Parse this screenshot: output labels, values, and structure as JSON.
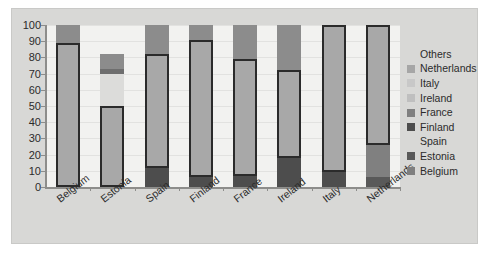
{
  "chart_data": {
    "type": "bar",
    "subtype": "stacked-bar-with-highlighted-segment",
    "title": "",
    "xlabel": "",
    "ylabel": "",
    "ylim": [
      0,
      100
    ],
    "ytick_labels": [
      "0",
      "10",
      "20",
      "30",
      "40",
      "50",
      "60",
      "70",
      "80",
      "90",
      "100"
    ],
    "ytick_values": [
      0,
      10,
      20,
      30,
      40,
      50,
      60,
      70,
      80,
      90,
      100
    ],
    "grid": true,
    "legend_position": "right",
    "categories": [
      "Belgium",
      "Estonia",
      "Spain",
      "Finland",
      "France",
      "Ireland",
      "Italy",
      "Netherlands"
    ],
    "series": [
      {
        "name": "Belgium",
        "color": "#7f7f7f",
        "values": [
          0,
          0,
          0,
          0,
          0,
          0,
          0,
          0
        ]
      },
      {
        "name": "Estonia",
        "color": "#595959",
        "values": [
          0,
          0,
          0,
          0,
          0,
          0,
          0,
          6
        ]
      },
      {
        "name": "Spain",
        "color": "#f2f2f0",
        "values": [
          0,
          0,
          0,
          0,
          0,
          0,
          0,
          0
        ]
      },
      {
        "name": "Finland",
        "color": "#4d4d4d",
        "values": [
          0,
          0,
          12,
          6,
          7,
          0,
          0,
          0
        ]
      },
      {
        "name": "France",
        "color": "#808080",
        "values": [
          0,
          0,
          0,
          0,
          0,
          18,
          9,
          20
        ]
      },
      {
        "name": "Ireland",
        "color": "#bfbfbf",
        "values": [
          0,
          0,
          0,
          0,
          0,
          0,
          0,
          0
        ]
      },
      {
        "name": "Italy",
        "color": "#c8c8c8",
        "values": [
          0,
          0,
          0,
          0,
          0,
          0,
          0,
          0
        ]
      },
      {
        "name": "Netherlands",
        "color": "#a6a6a6",
        "values": [
          0,
          0,
          0,
          0,
          0,
          0,
          0,
          0
        ]
      },
      {
        "name": "Others",
        "color": "#8c8c8c",
        "values": [
          11,
          18,
          18,
          9,
          21,
          28,
          0,
          0
        ]
      }
    ],
    "highlighted_values": [
      89,
      50,
      70,
      85,
      72,
      54,
      91,
      74
    ],
    "bars": [
      {
        "category": "Belgium",
        "below": 0,
        "main_start": 0,
        "main_end": 89,
        "above_start": 89,
        "above_end": 100
      },
      {
        "category": "Estonia",
        "below": 0,
        "main_start": 0,
        "main_end": 50,
        "above_start": 70,
        "above_end": 82,
        "gap_note": "separate floating segment 70-82"
      },
      {
        "category": "Spain",
        "below": 12,
        "main_start": 12,
        "main_end": 82,
        "above_start": 82,
        "above_end": 100
      },
      {
        "category": "Finland",
        "below": 6,
        "main_start": 6,
        "main_end": 91,
        "above_start": 91,
        "above_end": 100
      },
      {
        "category": "France",
        "below": 7,
        "main_start": 7,
        "main_end": 79,
        "above_start": 79,
        "above_end": 100
      },
      {
        "category": "Ireland",
        "below": 18,
        "main_start": 18,
        "main_end": 72,
        "above_start": 72,
        "above_end": 100
      },
      {
        "category": "Italy",
        "below": 9,
        "main_start": 9,
        "main_end": 100,
        "above_start": 100,
        "above_end": 100
      },
      {
        "category": "Netherlands",
        "below": 26,
        "main_start": 26,
        "main_end": 100,
        "above_start": 100,
        "above_end": 100
      }
    ]
  },
  "legend": {
    "items": [
      {
        "label": "Others",
        "swatch": "none",
        "color": ""
      },
      {
        "label": "Netherlands",
        "swatch": "filled",
        "color": "#a6a6a6"
      },
      {
        "label": "Italy",
        "swatch": "filled",
        "color": "#c8c8c8"
      },
      {
        "label": "Ireland",
        "swatch": "filled",
        "color": "#bfbfbf"
      },
      {
        "label": "France",
        "swatch": "filled",
        "color": "#808080"
      },
      {
        "label": "Finland",
        "swatch": "filled",
        "color": "#4d4d4d"
      },
      {
        "label": "Spain",
        "swatch": "none",
        "color": ""
      },
      {
        "label": "Estonia",
        "swatch": "filled",
        "color": "#595959"
      },
      {
        "label": "Belgium",
        "swatch": "filled",
        "color": "#7f7f7f"
      }
    ]
  },
  "colors": {
    "panel_background": "#d8d8d6",
    "plot_background": "#f2f2f0",
    "gridline": "#e2e2e0",
    "axis": "#8d8d8b",
    "bar_outline": "#2b2b2b",
    "text": "#2b2b2b"
  }
}
